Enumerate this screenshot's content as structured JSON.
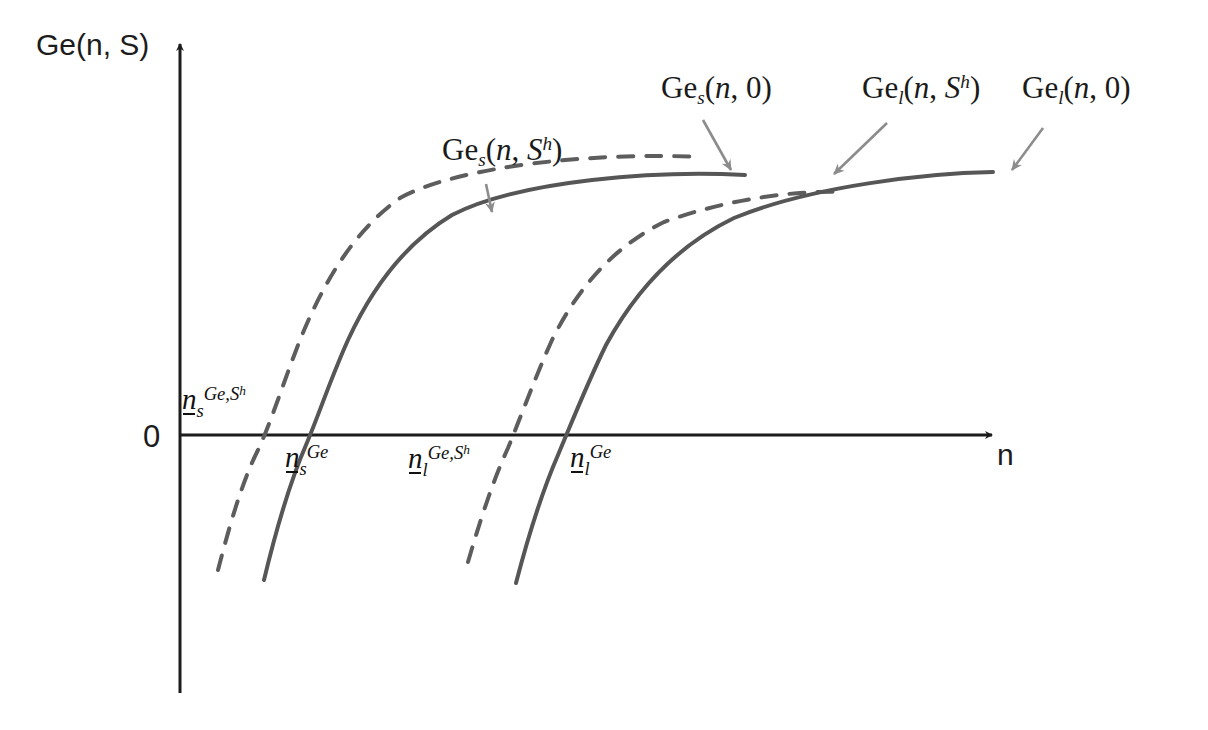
{
  "figure": {
    "type": "diagram",
    "background_color": "#ffffff",
    "axes": {
      "y_axis_label": "Ge(n, S)",
      "x_axis_label": "n",
      "origin_label": "0",
      "axis_color": "#1c1c1c",
      "x_axis_y_px": 435,
      "y_axis_x_px": 180
    },
    "curve_labels": [
      {
        "id": "ge-s-sh",
        "text_plain": "Ge_s(n, S^h)",
        "base": "Ge",
        "sub": "s",
        "args_open": "(",
        "arg1": "n",
        "comma": ", ",
        "arg2": "S",
        "arg2_sup": "h",
        "args_close": ")"
      },
      {
        "id": "ge-s-0",
        "text_plain": "Ge_s(n, 0)",
        "base": "Ge",
        "sub": "s",
        "args_open": "(",
        "arg1": "n",
        "comma": ", ",
        "arg2": "0",
        "arg2_sup": "",
        "args_close": ")"
      },
      {
        "id": "ge-l-sh",
        "text_plain": "Ge_l(n, S^h)",
        "base": "Ge",
        "sub": "l",
        "args_open": "(",
        "arg1": "n",
        "comma": ", ",
        "arg2": "S",
        "arg2_sup": "h",
        "args_close": ")"
      },
      {
        "id": "ge-l-0",
        "text_plain": "Ge_l(n, 0)",
        "base": "Ge",
        "sub": "l",
        "args_open": "(",
        "arg1": "n",
        "comma": ", ",
        "arg2": "0",
        "arg2_sup": "",
        "args_close": ")"
      }
    ],
    "threshold_labels": [
      {
        "id": "n-s-ge-sh",
        "text_plain": "n_s^{Ge,S^h}",
        "base": "n",
        "sub": "s",
        "sup": "Ge,S",
        "sup_sup": "h"
      },
      {
        "id": "n-s-ge",
        "text_plain": "n_s^{Ge}",
        "base": "n",
        "sub": "s",
        "sup": "Ge",
        "sup_sup": ""
      },
      {
        "id": "n-l-ge-sh",
        "text_plain": "n_l^{Ge,S^h}",
        "base": "n",
        "sub": "l",
        "sup": "Ge,S",
        "sup_sup": "h"
      },
      {
        "id": "n-l-ge",
        "text_plain": "n_l^{Ge}",
        "base": "n",
        "sub": "l",
        "sup": "Ge",
        "sup_sup": ""
      }
    ],
    "curves": [
      {
        "id": "curve-ge-s-sh",
        "label": "Ge_s(n, S^h)",
        "style": "dashed",
        "color": "#5d5d5d",
        "x_axis_crossing_px": 265,
        "path": "M 218 570 C 236 500 248 470 258 450 C 272 420 282 386 300 340 C 322 286 352 232 400 198 C 460 165 600 152 700 157"
      },
      {
        "id": "curve-ge-s-0",
        "label": "Ge_s(n, 0)",
        "style": "solid",
        "color": "#565656",
        "x_axis_crossing_px": 313,
        "path": "M 264 580 C 282 505 296 468 306 445 C 320 412 330 380 348 340 C 372 288 404 244 452 215 C 520 180 660 170 745 175"
      },
      {
        "id": "curve-ge-l-sh",
        "label": "Ge_l(n, S^h)",
        "style": "dashed",
        "color": "#5d5d5d",
        "x_axis_crossing_px": 520,
        "path": "M 468 562 C 486 500 498 470 508 448 C 522 414 534 380 552 340 C 578 288 612 248 664 222 C 730 198 800 190 845 192"
      },
      {
        "id": "curve-ge-l-0",
        "label": "Ge_l(n, 0)",
        "style": "solid",
        "color": "#565656",
        "x_axis_crossing_px": 565,
        "path": "M 516 583 C 534 514 548 478 558 455 C 572 422 586 386 606 345 C 636 290 676 246 734 218 C 812 186 928 173 993 172"
      }
    ],
    "annotation_arrows": [
      {
        "id": "arrow-ge-s-sh",
        "from_px": [
          486,
          184
        ],
        "to_px": [
          492,
          212
        ],
        "color": "#8c8c8c"
      },
      {
        "id": "arrow-ge-s-0",
        "from_px": [
          703,
          120
        ],
        "to_px": [
          731,
          170
        ],
        "color": "#8c8c8c"
      },
      {
        "id": "arrow-ge-l-sh",
        "from_px": [
          887,
          123
        ],
        "to_px": [
          834,
          174
        ],
        "color": "#8c8c8c"
      },
      {
        "id": "arrow-ge-l-0",
        "from_px": [
          1043,
          128
        ],
        "to_px": [
          1012,
          170
        ],
        "color": "#8c8c8c"
      }
    ]
  }
}
